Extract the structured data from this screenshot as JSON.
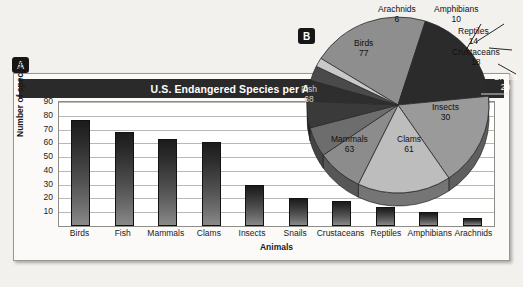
{
  "figure": {
    "background_color": "#f2f1ee",
    "panel_a_label": "A",
    "panel_b_label": "B"
  },
  "bar_panel": {
    "title": "U.S. Endangered Species per Animal Group",
    "title_bar_color": "#2a2a2a",
    "bar_color": "#2d2d2d",
    "plot_background": "#ffffff"
  },
  "chart_data": [
    {
      "type": "bar",
      "title": "U.S. Endangered Species per Animal Group",
      "xlabel": "Animals",
      "ylabel": "Number of species",
      "ylim": [
        0,
        90
      ],
      "yticks": [
        90,
        80,
        70,
        60,
        50,
        40,
        30,
        20,
        10
      ],
      "grid": true,
      "legend": "none",
      "categories": [
        "Birds",
        "Fish",
        "Mammals",
        "Clams",
        "Insects",
        "Snails",
        "Crustaceans",
        "Reptiles",
        "Amphibians",
        "Arachnids"
      ],
      "values": [
        77,
        68,
        63,
        61,
        30,
        20,
        18,
        14,
        10,
        6
      ]
    },
    {
      "type": "pie",
      "title": "",
      "labels": [
        "Birds",
        "Fish",
        "Mammals",
        "Clams",
        "Insects",
        "Snails",
        "Crustaceans",
        "Reptiles",
        "Amphibians",
        "Arachnids"
      ],
      "values": [
        77,
        68,
        63,
        61,
        30,
        20,
        18,
        14,
        10,
        6
      ],
      "total": 367,
      "legend": "labels-on-slices",
      "slice_colors": [
        "#8e8e8e",
        "#2b2b2b",
        "#9a9a9a",
        "#bdbdbd",
        "#8c8c8c",
        "#6d6d6d",
        "#3a3a3a",
        "#2e2e2e",
        "#4a4a4a",
        "#c9c9c9"
      ]
    }
  ]
}
